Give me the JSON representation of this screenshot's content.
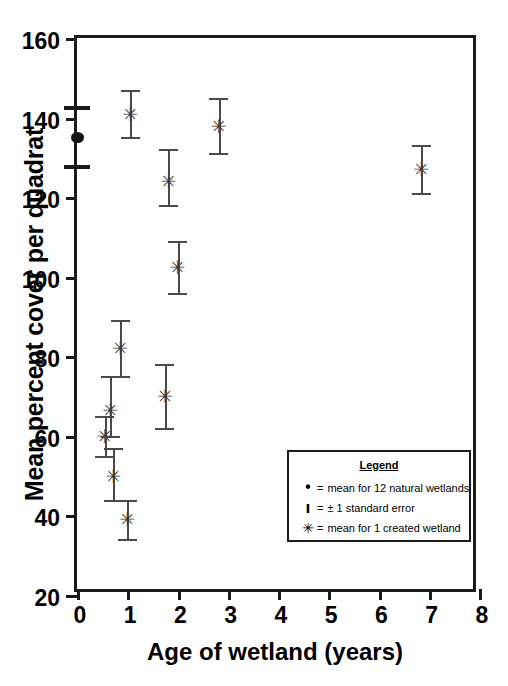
{
  "chart_data": {
    "type": "scatter",
    "title": "",
    "xlabel": "Age of wetland (years)",
    "ylabel": "Mean percent cover per quadrat",
    "xlim": [
      0,
      8
    ],
    "ylim": [
      20,
      160
    ],
    "xticks": [
      "0",
      "1",
      "2",
      "3",
      "4",
      "5",
      "6",
      "7",
      "8"
    ],
    "yticks": [
      "20",
      "40",
      "60",
      "80",
      "100",
      "120",
      "140",
      "160"
    ],
    "grid": false,
    "legend_position": "inside-lower-right",
    "series": [
      {
        "name": "mean for 1 created wetland",
        "marker": "asterisk",
        "points": [
          {
            "x": 0.55,
            "y": 60.0,
            "yerr_low": 55.0,
            "yerr_high": 65.0
          },
          {
            "x": 0.66,
            "y": 66.5,
            "yerr_low": 60.0,
            "yerr_high": 75.0
          },
          {
            "x": 0.72,
            "y": 50.0,
            "yerr_low": 44.0,
            "yerr_high": 57.0
          },
          {
            "x": 0.86,
            "y": 82.0,
            "yerr_low": 75.0,
            "yerr_high": 89.0
          },
          {
            "x": 1.0,
            "y": 39.0,
            "yerr_low": 34.0,
            "yerr_high": 44.0
          },
          {
            "x": 1.06,
            "y": 141.0,
            "yerr_low": 135.0,
            "yerr_high": 147.0
          },
          {
            "x": 1.75,
            "y": 70.0,
            "yerr_low": 62.0,
            "yerr_high": 78.0
          },
          {
            "x": 1.82,
            "y": 124.0,
            "yerr_low": 118.0,
            "yerr_high": 132.0
          },
          {
            "x": 2.0,
            "y": 102.5,
            "yerr_low": 96.0,
            "yerr_high": 109.0
          },
          {
            "x": 2.82,
            "y": 138.0,
            "yerr_low": 131.0,
            "yerr_high": 145.0
          },
          {
            "x": 6.85,
            "y": 127.0,
            "yerr_low": 121.0,
            "yerr_high": 133.0
          }
        ]
      },
      {
        "name": "mean for 12 natural wetlands",
        "marker": "dot",
        "points": [
          {
            "x": 0.0,
            "y": 135.0,
            "yerr_low": 128.0,
            "yerr_high": 143.0
          }
        ]
      }
    ]
  },
  "legend": {
    "title": "Legend",
    "rows": [
      {
        "symbol": "•",
        "equals": "=",
        "text": "mean for 12 natural wetlands"
      },
      {
        "symbol": "I",
        "equals": "=",
        "text": "± 1 standard error"
      },
      {
        "symbol": "✳",
        "equals": "=",
        "text": "mean for 1 created wetland"
      }
    ]
  }
}
